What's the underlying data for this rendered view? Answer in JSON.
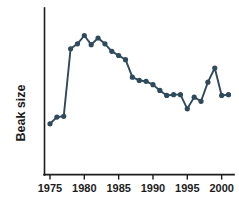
{
  "chart_data": {
    "type": "line",
    "title": "",
    "subtitle": "",
    "xlabel": "",
    "ylabel": "Beak size",
    "xlim": [
      1974.2,
      2001.8
    ],
    "ylim": [
      0,
      10
    ],
    "xticks": [
      1975,
      1980,
      1985,
      1990,
      1995,
      2000
    ],
    "xtick_labels": [
      "1975",
      "1980",
      "1985",
      "1990",
      "1995",
      "2000"
    ],
    "yticks": [],
    "ytick_labels": [],
    "grid": false,
    "legend": null,
    "legend_position": "none",
    "series": [
      {
        "name": "Beak size",
        "color": "#2e4a5b",
        "marker": "circle",
        "x": [
          1975,
          1976,
          1977,
          1978,
          1979,
          1980,
          1981,
          1982,
          1983,
          1984,
          1985,
          1986,
          1987,
          1988,
          1989,
          1990,
          1991,
          1992,
          1993,
          1994,
          1995,
          1996,
          1997,
          1998,
          1999,
          2000,
          2001
        ],
        "values": [
          3.05,
          3.45,
          3.5,
          7.55,
          7.85,
          8.35,
          7.8,
          8.2,
          7.85,
          7.4,
          7.15,
          6.9,
          5.85,
          5.65,
          5.6,
          5.4,
          5.05,
          4.75,
          4.8,
          4.8,
          3.95,
          4.65,
          4.4,
          5.55,
          6.4,
          4.75,
          4.8
        ]
      }
    ],
    "annotations": []
  },
  "axes": {
    "y_axis_label": "Beak size",
    "x_axis_label": ""
  },
  "colors": {
    "line": "#2e4a5b",
    "marker": "#2e4a5b",
    "axis": "#1c1c1c",
    "background": "#ffffff"
  }
}
